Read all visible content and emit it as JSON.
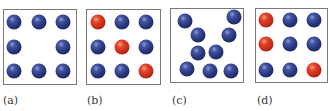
{
  "figure": {
    "panels": [
      {
        "label": "(a)",
        "description": "vacancy defect",
        "box": {
          "x": 3,
          "y": 9,
          "w": 74,
          "h": 76
        },
        "atoms": [
          {
            "x": 14,
            "y": 22,
            "color": "blue"
          },
          {
            "x": 39,
            "y": 22,
            "color": "blue"
          },
          {
            "x": 63,
            "y": 22,
            "color": "blue"
          },
          {
            "x": 14,
            "y": 47,
            "color": "blue"
          },
          {
            "x": 63,
            "y": 47,
            "color": "blue"
          },
          {
            "x": 14,
            "y": 71,
            "color": "blue"
          },
          {
            "x": 39,
            "y": 71,
            "color": "blue"
          },
          {
            "x": 63,
            "y": 71,
            "color": "blue"
          }
        ]
      },
      {
        "label": "(b)",
        "description": "substitutional impurities on diagonal",
        "box": {
          "x": 86,
          "y": 9,
          "w": 75,
          "h": 76
        },
        "atoms": [
          {
            "x": 98,
            "y": 22,
            "color": "red"
          },
          {
            "x": 122,
            "y": 22,
            "color": "blue"
          },
          {
            "x": 146,
            "y": 22,
            "color": "blue"
          },
          {
            "x": 98,
            "y": 47,
            "color": "blue"
          },
          {
            "x": 122,
            "y": 47,
            "color": "red"
          },
          {
            "x": 146,
            "y": 47,
            "color": "blue"
          },
          {
            "x": 98,
            "y": 71,
            "color": "blue"
          },
          {
            "x": 122,
            "y": 71,
            "color": "blue"
          },
          {
            "x": 146,
            "y": 71,
            "color": "red"
          }
        ]
      },
      {
        "label": "(c)",
        "description": "disordered / amorphous arrangement",
        "box": {
          "x": 170,
          "y": 8,
          "w": 74,
          "h": 75
        },
        "atoms": [
          {
            "x": 185,
            "y": 21,
            "color": "blue"
          },
          {
            "x": 234,
            "y": 17,
            "color": "blue"
          },
          {
            "x": 198,
            "y": 35,
            "color": "blue"
          },
          {
            "x": 229,
            "y": 35,
            "color": "blue"
          },
          {
            "x": 198,
            "y": 53,
            "color": "blue"
          },
          {
            "x": 216,
            "y": 52,
            "color": "blue"
          },
          {
            "x": 187,
            "y": 69,
            "color": "blue"
          },
          {
            "x": 210,
            "y": 71,
            "color": "blue"
          },
          {
            "x": 231,
            "y": 71,
            "color": "blue"
          }
        ]
      },
      {
        "label": "(d)",
        "description": "substitutional impurities",
        "box": {
          "x": 255,
          "y": 8,
          "w": 73,
          "h": 75
        },
        "atoms": [
          {
            "x": 266,
            "y": 20,
            "color": "red"
          },
          {
            "x": 290,
            "y": 20,
            "color": "blue"
          },
          {
            "x": 314,
            "y": 20,
            "color": "blue"
          },
          {
            "x": 266,
            "y": 44,
            "color": "red"
          },
          {
            "x": 290,
            "y": 44,
            "color": "blue"
          },
          {
            "x": 314,
            "y": 44,
            "color": "blue"
          },
          {
            "x": 266,
            "y": 70,
            "color": "blue"
          },
          {
            "x": 290,
            "y": 70,
            "color": "blue"
          },
          {
            "x": 314,
            "y": 70,
            "color": "red"
          }
        ]
      }
    ],
    "label_positions": [
      3,
      87,
      172,
      257
    ],
    "colors": {
      "blue_atom": "#27357a",
      "red_atom": "#c22b18",
      "border": "#7a7a7a",
      "label_text": "#3a3a3a"
    }
  }
}
